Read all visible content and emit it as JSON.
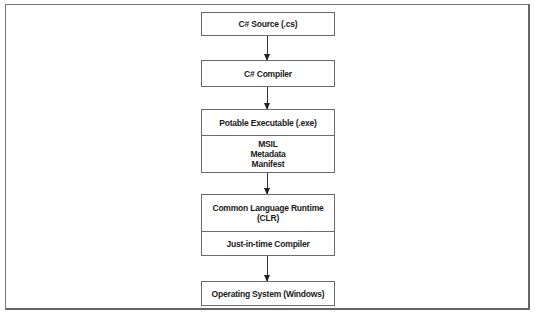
{
  "diagram": {
    "type": "flowchart",
    "direction": "top-to-bottom",
    "nodes": [
      {
        "id": "source",
        "sections": [
          {
            "label": "C# Source (.cs)"
          }
        ]
      },
      {
        "id": "compiler",
        "sections": [
          {
            "label": "C# Compiler"
          }
        ]
      },
      {
        "id": "pe",
        "sections": [
          {
            "label": "Potable Executable (.exe)"
          },
          {
            "lines": [
              "MSIL",
              "Metadata",
              "Manifest"
            ]
          }
        ]
      },
      {
        "id": "clr",
        "sections": [
          {
            "label": "Common Language Runtime (CLR)"
          },
          {
            "label": "Just-in-time Compiler"
          }
        ]
      },
      {
        "id": "os",
        "sections": [
          {
            "label": "Operating System (Windows)"
          }
        ]
      }
    ],
    "edges": [
      {
        "from": "source",
        "to": "compiler"
      },
      {
        "from": "compiler",
        "to": "pe"
      },
      {
        "from": "pe",
        "to": "clr"
      },
      {
        "from": "clr",
        "to": "os"
      }
    ]
  }
}
